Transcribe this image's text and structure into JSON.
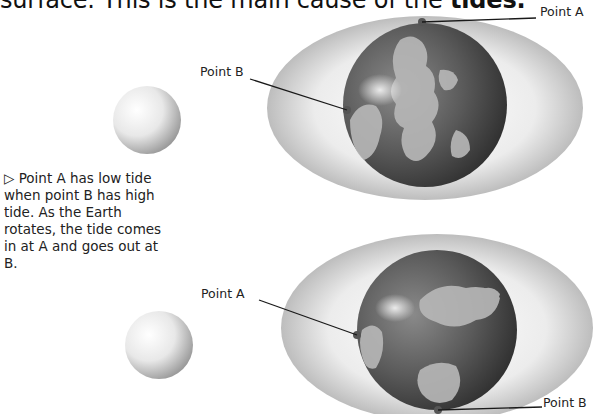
{
  "heading": {
    "prefix": "surface. This is the main cause of the ",
    "bold": "tides."
  },
  "caption": {
    "marker": "▷",
    "text": " Point A has low tide when point B has high tide. As the Earth rotates, the tide comes in at A and goes out at B."
  },
  "top_diagram": {
    "labels": {
      "point_a": "Point A",
      "point_b": "Point B"
    }
  },
  "bottom_diagram": {
    "labels": {
      "point_a": "Point A",
      "point_b": "Point B"
    }
  },
  "colors": {
    "water_bulge": "#e4e4e4",
    "globe_dark": "#4a4a4a",
    "land": "#bdbdbd",
    "moon": "#eeeeee",
    "leader_line": "#1a1a1a"
  }
}
